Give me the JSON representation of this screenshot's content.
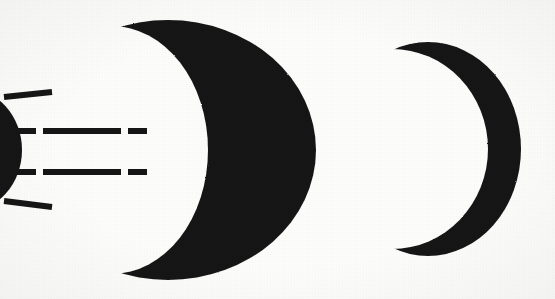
{
  "figure": {
    "background_color": "#fdfdfc",
    "ink_color": "#161616",
    "width": 555,
    "height": 299,
    "shapes": [
      {
        "name": "left-partial-disc",
        "kind": "clipped-crescent",
        "description": "Dark rounded mass clipped by the left image edge",
        "fill": "#161616",
        "bbox": [
          0,
          88,
          22,
          210
        ]
      },
      {
        "name": "large-crescent",
        "kind": "crescent",
        "description": "Large crescent moon opening toward the left",
        "fill": "#161616",
        "bbox": [
          143,
          20,
          316,
          279
        ],
        "outer_center_x": 168,
        "outer_center_y": 150,
        "outer_radius_x": 148,
        "outer_radius_y": 130,
        "inner_center_x": 112,
        "inner_center_y": 150,
        "inner_radius_x": 96,
        "inner_radius_y": 124
      },
      {
        "name": "small-crescent",
        "kind": "crescent",
        "description": "Smaller crescent moon opening toward the left",
        "fill": "#161616",
        "bbox": [
          412,
          42,
          521,
          256
        ],
        "outer_center_x": 428,
        "outer_center_y": 149,
        "outer_radius_x": 93,
        "outer_radius_y": 107,
        "inner_center_x": 392,
        "inner_center_y": 149,
        "inner_radius_x": 96,
        "inner_radius_y": 100
      }
    ],
    "rays": [
      {
        "name": "ray-top",
        "angle_label": "upper diagonal",
        "segments": [
          {
            "x1": 4,
            "y1": 97,
            "x2": 52,
            "y2": 92
          }
        ],
        "stroke_width": 6
      },
      {
        "name": "ray-upper-middle",
        "angle_label": "upper horizontal",
        "segments": [
          {
            "x1": 6,
            "y1": 131,
            "x2": 36,
            "y2": 131
          },
          {
            "x1": 43,
            "y1": 131,
            "x2": 121,
            "y2": 131
          },
          {
            "x1": 128,
            "y1": 131,
            "x2": 147,
            "y2": 131
          }
        ],
        "stroke_width": 6
      },
      {
        "name": "ray-lower-middle",
        "angle_label": "lower horizontal",
        "segments": [
          {
            "x1": 6,
            "y1": 172,
            "x2": 36,
            "y2": 172
          },
          {
            "x1": 43,
            "y1": 172,
            "x2": 121,
            "y2": 172
          },
          {
            "x1": 128,
            "y1": 172,
            "x2": 147,
            "y2": 172
          }
        ],
        "stroke_width": 6
      },
      {
        "name": "ray-bottom",
        "angle_label": "lower diagonal",
        "segments": [
          {
            "x1": 4,
            "y1": 201,
            "x2": 52,
            "y2": 207
          }
        ],
        "stroke_width": 6
      }
    ]
  }
}
